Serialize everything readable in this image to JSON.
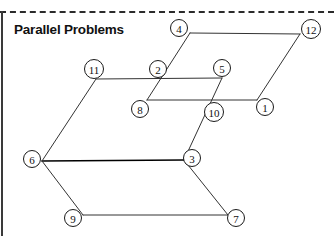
{
  "figure": {
    "title": "Parallel Problems",
    "top_rule": "dashed-horizontal-rule",
    "left_rule": "vertical-edge-rule",
    "background_color": "#ffffff",
    "line_color": "#333333",
    "label_color": "#111111"
  },
  "nodes": [
    {
      "id": "n1",
      "label": "1",
      "cx": 265,
      "cy": 107,
      "r": 8.5,
      "vertex_x": 257,
      "vertex_y": 100
    },
    {
      "id": "n2",
      "label": "2",
      "cx": 158,
      "cy": 69,
      "r": 8.5,
      "vertex_x": 166,
      "vertex_y": 78
    },
    {
      "id": "n3",
      "label": "3",
      "cx": 192,
      "cy": 158,
      "r": 8.5,
      "vertex_x": 184,
      "vertex_y": 160
    },
    {
      "id": "n4",
      "label": "4",
      "cx": 179,
      "cy": 28,
      "r": 8.5,
      "vertex_x": 190,
      "vertex_y": 33
    },
    {
      "id": "n5",
      "label": "5",
      "cx": 222,
      "cy": 68,
      "r": 8.5,
      "vertex_x": 222,
      "vertex_y": 78
    },
    {
      "id": "n6",
      "label": "6",
      "cx": 32,
      "cy": 159,
      "r": 8.5,
      "vertex_x": 42,
      "vertex_y": 161
    },
    {
      "id": "n7",
      "label": "7",
      "cx": 236,
      "cy": 218,
      "r": 8.5,
      "vertex_x": 228,
      "vertex_y": 215
    },
    {
      "id": "n8",
      "label": "8",
      "cx": 140,
      "cy": 109,
      "r": 8.5,
      "vertex_x": 147,
      "vertex_y": 100
    },
    {
      "id": "n9",
      "label": "9",
      "cx": 73,
      "cy": 218,
      "r": 8.5,
      "vertex_x": 83,
      "vertex_y": 215
    },
    {
      "id": "n10",
      "label": "10",
      "cx": 214,
      "cy": 112,
      "r": 9.5,
      "vertex_x": 207,
      "vertex_y": 103
    },
    {
      "id": "n11",
      "label": "11",
      "cx": 94,
      "cy": 69,
      "r": 9.5,
      "vertex_x": 96,
      "vertex_y": 79
    },
    {
      "id": "n12",
      "label": "12",
      "cx": 311,
      "cy": 29,
      "r": 9.5,
      "vertex_x": 300,
      "vertex_y": 34
    }
  ],
  "edges": [
    {
      "id": "e-4-12",
      "from": "4",
      "to": "12",
      "x1": 190,
      "y1": 33,
      "x2": 300,
      "y2": 34,
      "weight": "normal"
    },
    {
      "id": "e-12-1",
      "from": "12",
      "to": "1",
      "x1": 300,
      "y1": 34,
      "x2": 257,
      "y2": 100,
      "weight": "normal"
    },
    {
      "id": "e-1-8",
      "from": "1",
      "to": "8",
      "x1": 257,
      "y1": 100,
      "x2": 147,
      "y2": 100,
      "weight": "normal"
    },
    {
      "id": "e-8-4",
      "from": "8",
      "to": "4",
      "x1": 147,
      "y1": 100,
      "x2": 190,
      "y2": 33,
      "weight": "normal"
    },
    {
      "id": "e-11-5",
      "from": "11",
      "to": "5",
      "x1": 96,
      "y1": 79,
      "x2": 222,
      "y2": 78,
      "weight": "normal"
    },
    {
      "id": "e-5-3",
      "from": "5",
      "to": "3",
      "x1": 222,
      "y1": 78,
      "x2": 184,
      "y2": 160,
      "weight": "normal"
    },
    {
      "id": "e-3-6",
      "from": "3",
      "to": "6",
      "x1": 184,
      "y1": 160,
      "x2": 42,
      "y2": 161,
      "weight": "bold"
    },
    {
      "id": "e-6-11",
      "from": "6",
      "to": "11",
      "x1": 42,
      "y1": 161,
      "x2": 96,
      "y2": 79,
      "weight": "normal"
    },
    {
      "id": "e-3-7",
      "from": "3",
      "to": "7",
      "x1": 184,
      "y1": 160,
      "x2": 228,
      "y2": 215,
      "weight": "normal"
    },
    {
      "id": "e-7-9",
      "from": "7",
      "to": "9",
      "x1": 228,
      "y1": 215,
      "x2": 83,
      "y2": 215,
      "weight": "normal"
    },
    {
      "id": "e-9-6",
      "from": "9",
      "to": "6",
      "x1": 83,
      "y1": 215,
      "x2": 42,
      "y2": 161,
      "weight": "normal"
    }
  ]
}
